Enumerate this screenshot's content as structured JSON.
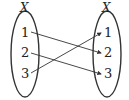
{
  "diagram": {
    "type": "function-mapping",
    "left_set": {
      "label": "X",
      "elements": [
        "1",
        "2",
        "3"
      ]
    },
    "right_set": {
      "label": "X",
      "elements": [
        "1",
        "2",
        "3"
      ]
    },
    "mappings": [
      {
        "from": "1",
        "to": "2"
      },
      {
        "from": "2",
        "to": "3"
      },
      {
        "from": "3",
        "to": "1"
      }
    ],
    "colors": {
      "stroke": "#333333",
      "background": "#ffffff"
    }
  }
}
